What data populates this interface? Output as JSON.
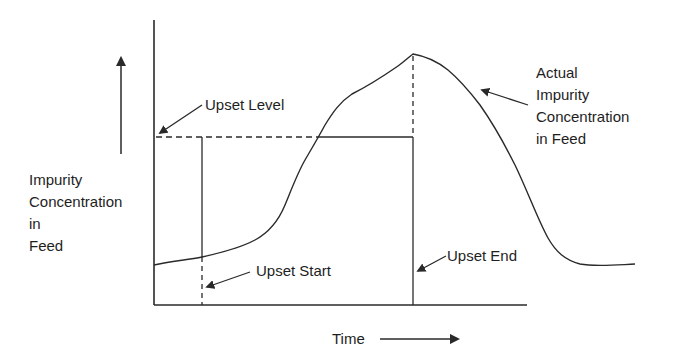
{
  "diagram": {
    "y_axis_label": [
      "Impurity",
      "Concentration",
      "in",
      "Feed"
    ],
    "x_axis_label": "Time",
    "annotations": {
      "upset_level": "Upset Level",
      "upset_start": "Upset Start",
      "upset_end": "Upset End",
      "actual_curve": [
        "Actual",
        "Impurity",
        "Concentration",
        "in Feed"
      ]
    },
    "colors": {
      "line": "#2a2a2a",
      "text": "#1e1e1e",
      "background": "#ffffff"
    }
  }
}
